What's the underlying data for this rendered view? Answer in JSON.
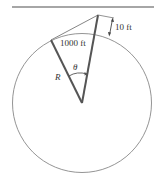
{
  "diagram": {
    "type": "geometry",
    "labels": {
      "arc_length": "1000 ft",
      "height": "10 ft",
      "angle": "θ",
      "radius": "R"
    },
    "colors": {
      "radii": "#555555",
      "lines": "#777777",
      "circle": "#888888",
      "rule": "#888888"
    }
  }
}
